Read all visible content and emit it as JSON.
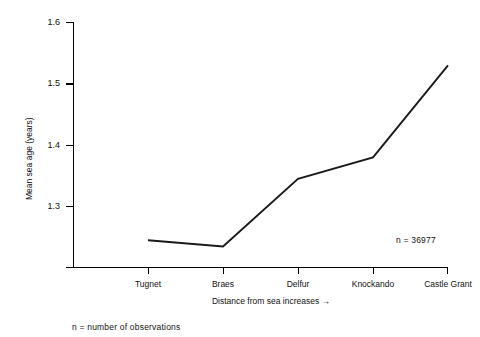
{
  "chart_data": {
    "type": "line",
    "title": "",
    "subtitle": "",
    "xlabel": "Distance from sea increases →",
    "ylabel": "Mean sea age (years)",
    "categories": [
      "Tugnet",
      "Braes",
      "Delfur",
      "Knockando",
      "Castle Grant"
    ],
    "values": [
      1.245,
      1.235,
      1.345,
      1.38,
      1.53
    ],
    "series": [
      {
        "name": "Mean sea age",
        "values": [
          1.245,
          1.235,
          1.345,
          1.38,
          1.53
        ]
      }
    ],
    "ylim": [
      1.23,
      1.6
    ],
    "yticks": [
      1.3,
      1.4,
      1.5,
      1.6
    ],
    "ytick_labels": [
      "1.3",
      "1.4",
      "1.5",
      "1.6"
    ],
    "xtick_labels": [
      "Tugnet",
      "Braes",
      "Delfur",
      "Knockando",
      "Castle Grant"
    ],
    "grid": false,
    "legend": false,
    "legend_position": "none",
    "annotations": [
      {
        "name": "sample-size",
        "text": "n = 36977"
      }
    ],
    "line_color": "#1a1a1a",
    "axis_color": "#000000",
    "background_color": "#ffffff"
  },
  "figure": {
    "footnote": "n = number of observations"
  }
}
